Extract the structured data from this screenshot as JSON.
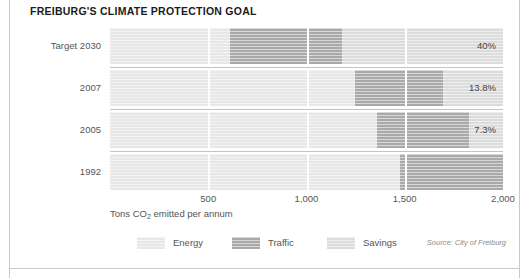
{
  "title": "FREIBURG'S CLIMATE PROTECTION GOAL",
  "axis_title": "Tons CO",
  "axis_title_sub": "2",
  "axis_title_rest": " emitted per annum",
  "source": "Source: City of Freiburg",
  "legend": [
    {
      "label": "Energy",
      "key": "energy",
      "color": "#e7e7e7"
    },
    {
      "label": "Traffic",
      "key": "traffic",
      "color": "#a9a9a9"
    },
    {
      "label": "Savings",
      "key": "savings",
      "color": "#dcdcdc"
    }
  ],
  "chart_data": {
    "type": "bar",
    "orientation": "horizontal",
    "stacked": true,
    "title": "FREIBURG'S CLIMATE PROTECTION GOAL",
    "xlabel": "Tons CO2 emitted per annum",
    "ylabel": "",
    "xlim": [
      0,
      2000
    ],
    "xticks": [
      500,
      1000,
      1500,
      2000
    ],
    "xticklabels": [
      "500",
      "1,000",
      "1,500",
      "2,000"
    ],
    "grid": true,
    "legend_position": "bottom-left",
    "categories": [
      "Target 2030",
      "2007",
      "2005",
      "1992"
    ],
    "series": [
      {
        "name": "Energy",
        "values": [
          610,
          1245,
          1360,
          1475
        ]
      },
      {
        "name": "Traffic",
        "values": [
          570,
          450,
          465,
          525
        ]
      },
      {
        "name": "Savings",
        "values": [
          820,
          305,
          175,
          0
        ]
      }
    ],
    "totals": [
      2000,
      2000,
      2000,
      2000
    ],
    "data_labels": [
      "40%",
      "13.8%",
      "7.3%",
      ""
    ],
    "annotation_note": "Percentages denote CO2 savings relative to the 1992 baseline.",
    "source": "Source: City of Freiburg"
  },
  "rows": [
    {
      "label": "Target 2030",
      "value_label": "40%",
      "segments": [
        {
          "key": "energy",
          "value": 610
        },
        {
          "key": "traffic",
          "value": 570
        },
        {
          "key": "savings",
          "value": 820
        }
      ]
    },
    {
      "label": "2007",
      "value_label": "13.8%",
      "segments": [
        {
          "key": "energy",
          "value": 1245
        },
        {
          "key": "traffic",
          "value": 450
        },
        {
          "key": "savings",
          "value": 305
        }
      ]
    },
    {
      "label": "2005",
      "value_label": "7.3%",
      "segments": [
        {
          "key": "energy",
          "value": 1360
        },
        {
          "key": "traffic",
          "value": 465
        },
        {
          "key": "savings",
          "value": 175
        }
      ]
    },
    {
      "label": "1992",
      "value_label": "",
      "segments": [
        {
          "key": "energy",
          "value": 1475
        },
        {
          "key": "traffic",
          "value": 525
        }
      ]
    }
  ]
}
